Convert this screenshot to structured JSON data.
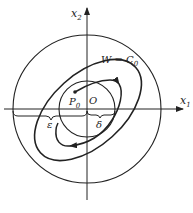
{
  "figure": {
    "type": "phase-plane diagram",
    "axes": {
      "x_label": "x",
      "x_sub": "1",
      "y_label": "x",
      "y_sub": "2"
    },
    "labels": {
      "origin": "O",
      "start_point": "P",
      "start_point_sub": "0",
      "level_set": "W = C",
      "level_set_sub": "0",
      "delta": "δ",
      "epsilon": "ε"
    },
    "elements": [
      "outer circle of radius ε",
      "inner circle of radius δ",
      "tilted ellipse level curve W = C0",
      "trajectory from P0 with arrows"
    ],
    "colors": {
      "stroke": "#222222",
      "background": "#ffffff"
    }
  }
}
